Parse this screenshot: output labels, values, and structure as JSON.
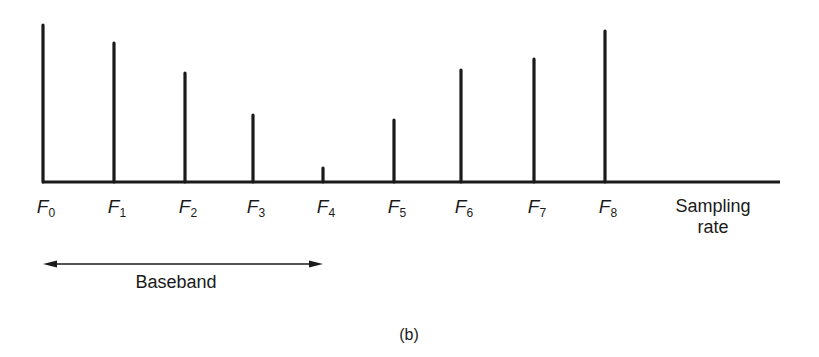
{
  "chart_data": {
    "type": "bar",
    "style": "stem/line spectrum",
    "title": "",
    "caption": "(b)",
    "categories": [
      "F0",
      "F1",
      "F2",
      "F3",
      "F4",
      "F5",
      "F6",
      "F7",
      "F8"
    ],
    "values": [
      157,
      139,
      109,
      67,
      14,
      62,
      112,
      123,
      151
    ],
    "value_units": "relative pixel height (no y-axis scale shown)",
    "xlabel": "Sampling rate",
    "ylabel": "",
    "grid": false,
    "legend": null,
    "annotations": [
      {
        "type": "double-arrow",
        "from": "F0",
        "to": "F4",
        "label": "Baseband"
      }
    ]
  },
  "labels": {
    "f": [
      {
        "base": "F",
        "sub": "0"
      },
      {
        "base": "F",
        "sub": "1"
      },
      {
        "base": "F",
        "sub": "2"
      },
      {
        "base": "F",
        "sub": "3"
      },
      {
        "base": "F",
        "sub": "4"
      },
      {
        "base": "F",
        "sub": "5"
      },
      {
        "base": "F",
        "sub": "6"
      },
      {
        "base": "F",
        "sub": "7"
      },
      {
        "base": "F",
        "sub": "8"
      }
    ],
    "xaxis_line1": "Sampling",
    "xaxis_line2": "rate",
    "baseband": "Baseband",
    "caption": "(b)"
  },
  "layout": {
    "x_positions": [
      43,
      114,
      185,
      253,
      323,
      394,
      461,
      534,
      605
    ],
    "baseline_y": 182,
    "axis_start_x": 42,
    "axis_end_x": 780,
    "stroke_color": "#1a1a1a"
  }
}
